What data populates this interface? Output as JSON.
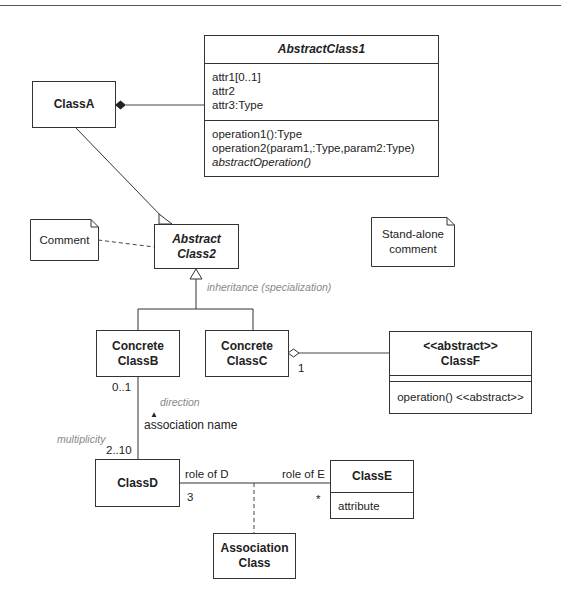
{
  "diagram": {
    "type": "UML class diagram",
    "classes": {
      "class_a": {
        "name": "ClassA"
      },
      "abstract_class1": {
        "name": "AbstractClass1",
        "attributes": [
          "attr1[0..1]",
          "attr2",
          "attr3:Type"
        ],
        "operations": [
          "operation1():Type",
          "operation2(param1,:Type,param2:Type)"
        ],
        "abstract_operation": "abstractOperation()"
      },
      "abstract_class2": {
        "name_line1": "Abstract",
        "name_line2": "Class2"
      },
      "concrete_class_b": {
        "name_line1": "Concrete",
        "name_line2": "ClassB"
      },
      "concrete_class_c": {
        "name_line1": "Concrete",
        "name_line2": "ClassC"
      },
      "class_f": {
        "stereotype": "<<abstract>>",
        "name": "ClassF",
        "operation": "operation() <<abstract>>"
      },
      "class_d": {
        "name": "ClassD"
      },
      "class_e": {
        "name": "ClassE",
        "attribute": "attribute"
      },
      "association_class": {
        "name_line1": "Association",
        "name_line2": "Class"
      }
    },
    "notes": {
      "comment": "Comment",
      "standalone_line1": "Stand-alone",
      "standalone_line2": "comment"
    },
    "labels": {
      "inheritance": "inheritance (specialization)",
      "direction": "direction",
      "association_name": "association name",
      "multiplicity": "multiplicity",
      "mult_b": "0..1",
      "mult_d_top": "2..10",
      "mult_c": "1",
      "role_d": "role of D",
      "role_e": "role of E",
      "mult_d_right": "3",
      "mult_e": "*",
      "direction_arrow": "▲"
    }
  }
}
